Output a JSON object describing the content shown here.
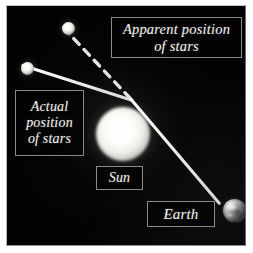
{
  "figure": {
    "background_color": "#030303",
    "frame_color": "#8e8b86"
  },
  "labels": {
    "apparent": {
      "line1": "Apparent position",
      "line2": "of stars",
      "text": "Apparent position of stars"
    },
    "actual": {
      "line1": "Actual",
      "line2": "position",
      "line3": "of stars",
      "text": "Actual position of stars"
    },
    "sun": "Sun",
    "earth": "Earth"
  },
  "bodies": {
    "sun": {
      "name": "Sun",
      "color": "#ffffff",
      "cx": 116,
      "cy": 128,
      "r": 27
    },
    "earth": {
      "name": "Earth",
      "color": "#b9b9b9",
      "cx": 227.5,
      "cy": 204.5,
      "r": 11.5
    },
    "star_upper": {
      "name": "star-upper",
      "color": "#ffffff",
      "cx": 61.5,
      "cy": 22.5,
      "r": 6.5
    },
    "star_lower": {
      "name": "star-lower",
      "color": "#ffffff",
      "cx": 20.5,
      "cy": 62.5,
      "r": 6.5
    }
  },
  "rays": {
    "apparent_ray": {
      "style": "dashed",
      "color": "#f0f0ec",
      "from": [
        63,
        26
      ],
      "to": [
        131,
        99
      ],
      "description": "dashed line showing apparent straight-line direction to the star"
    },
    "actual_ray_incoming": {
      "style": "solid",
      "color": "#efefea",
      "from": [
        22,
        64
      ],
      "to": [
        131,
        99
      ],
      "description": "solid line: real starlight approaching the Sun"
    },
    "actual_ray_deflected": {
      "style": "solid",
      "color": "#efefea",
      "from": [
        131,
        99
      ],
      "to": [
        219,
        202
      ],
      "description": "solid line: starlight bent by the Sun's gravity, reaching Earth"
    }
  }
}
